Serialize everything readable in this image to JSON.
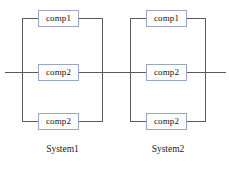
{
  "diagram": {
    "background_color": "#ffffff",
    "wire_color": "#5a5a5a",
    "box_border_color": "#93a9c4",
    "box_fill_color": "#ffffff",
    "text_color": "#111111"
  },
  "systems": [
    {
      "label": "System1",
      "blocks": [
        {
          "label": "comp1",
          "branch": "top"
        },
        {
          "label": "comp2",
          "branch": "middle"
        },
        {
          "label": "comp2",
          "branch": "bottom"
        }
      ]
    },
    {
      "label": "System2",
      "blocks": [
        {
          "label": "comp1",
          "branch": "top"
        },
        {
          "label": "comp2",
          "branch": "middle"
        },
        {
          "label": "comp2",
          "branch": "bottom"
        }
      ]
    }
  ]
}
